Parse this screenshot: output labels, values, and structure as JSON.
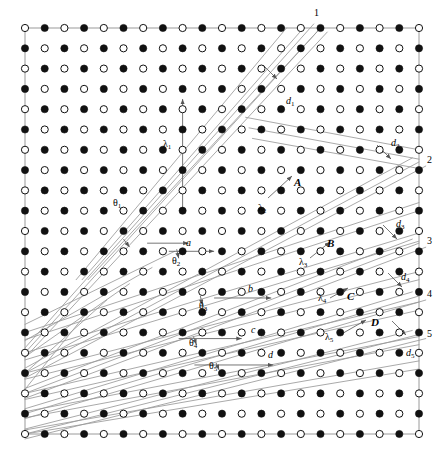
{
  "figure": {
    "type": "crystal-lattice-diffraction-diagram",
    "width": 444,
    "height": 453,
    "background_color": "#ffffff",
    "lattice": {
      "columns": 21,
      "rows": 21,
      "origin_x": 25,
      "origin_y": 28,
      "spacing_x": 19.7,
      "spacing_y": 20.3,
      "filled_color": "#111111",
      "open_color": "#ffffff",
      "open_stroke": "#111111",
      "radius": 3.6,
      "pattern": "checkerboard-alternating-open-and-filled",
      "corner_parity": "open-circle-at-top-left"
    },
    "line_color": "#9a9a9a",
    "border_color": "#9a9a9a"
  },
  "order_labels": [
    {
      "text": "1",
      "x": 314,
      "y": 8
    },
    {
      "text": "2",
      "x": 427,
      "y": 155
    },
    {
      "text": "3",
      "x": 427,
      "y": 236
    },
    {
      "text": "4",
      "x": 427,
      "y": 289
    },
    {
      "text": "5",
      "x": 427,
      "y": 329
    }
  ],
  "path_difference_labels": [
    {
      "text": "d",
      "sub": "1",
      "x": 286,
      "y": 96
    },
    {
      "text": "d",
      "sub": "2",
      "x": 391,
      "y": 138
    },
    {
      "text": "d",
      "sub": "3",
      "x": 396,
      "y": 219
    },
    {
      "text": "d",
      "sub": "4",
      "x": 401,
      "y": 272
    },
    {
      "text": "d",
      "sub": "5",
      "x": 406,
      "y": 348
    }
  ],
  "wavelength_labels": [
    {
      "text": "λ",
      "sub": "1",
      "x": 163,
      "y": 139
    },
    {
      "text": "λ",
      "sub": "2",
      "x": 258,
      "y": 203
    },
    {
      "text": "λ",
      "sub": "3",
      "x": 299,
      "y": 257
    },
    {
      "text": "λ",
      "sub": "4",
      "x": 318,
      "y": 293
    },
    {
      "text": "λ",
      "sub": "5",
      "x": 325,
      "y": 332
    }
  ],
  "angle_labels": [
    {
      "text": "θ",
      "sub": "1",
      "x": 113,
      "y": 198
    },
    {
      "text": "θ",
      "sub": "2",
      "x": 172,
      "y": 256
    },
    {
      "text": "θ",
      "sub": "3",
      "x": 199,
      "y": 301
    },
    {
      "text": "θ",
      "sub": "4",
      "x": 189,
      "y": 338
    },
    {
      "text": "θ",
      "sub": "5",
      "x": 209,
      "y": 361
    }
  ],
  "spacing_labels": [
    {
      "text": "a",
      "x": 186,
      "y": 238
    },
    {
      "text": "b",
      "x": 248,
      "y": 284
    },
    {
      "text": "c",
      "x": 251,
      "y": 325
    },
    {
      "text": "d",
      "x": 268,
      "y": 350
    }
  ],
  "point_labels": [
    {
      "text": "A",
      "x": 294,
      "y": 177
    },
    {
      "text": "B",
      "x": 327,
      "y": 238
    },
    {
      "text": "C",
      "x": 347,
      "y": 291
    },
    {
      "text": "D",
      "x": 371,
      "y": 317
    }
  ],
  "chart_data": {
    "type": "scatter",
    "title": "",
    "xlabel": "",
    "ylabel": "",
    "grid": true,
    "legend_position": "none"
  }
}
